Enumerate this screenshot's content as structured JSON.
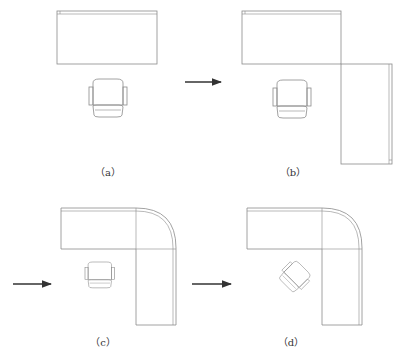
{
  "panels": [
    {
      "id": "a",
      "label": "（a）"
    },
    {
      "id": "b",
      "label": "（b）"
    },
    {
      "id": "c",
      "label": "（c）"
    },
    {
      "id": "d",
      "label": "（d）"
    }
  ],
  "colors": {
    "line": "#8a8a8a",
    "arrow": "#333333",
    "background": "#ffffff"
  }
}
